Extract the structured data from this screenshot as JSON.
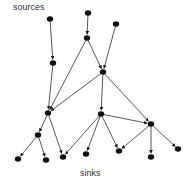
{
  "labels": {
    "top": "sources",
    "bottom": "sinks"
  },
  "colors": {
    "node": "#111111",
    "edge": "#444444",
    "text": "#333333",
    "background": "#ffffff"
  },
  "graph": {
    "type": "directed-acyclic-graph",
    "nodes": [
      {
        "id": "s1",
        "x": 50,
        "y": 19,
        "role": "source"
      },
      {
        "id": "s2",
        "x": 88,
        "y": 13,
        "role": "source"
      },
      {
        "id": "s3",
        "x": 116,
        "y": 24,
        "role": "source"
      },
      {
        "id": "a",
        "x": 87,
        "y": 38,
        "role": "internal"
      },
      {
        "id": "b",
        "x": 53,
        "y": 63,
        "role": "internal"
      },
      {
        "id": "c",
        "x": 103,
        "y": 72,
        "role": "internal"
      },
      {
        "id": "d",
        "x": 48,
        "y": 113,
        "role": "internal"
      },
      {
        "id": "e",
        "x": 101,
        "y": 114,
        "role": "internal"
      },
      {
        "id": "f",
        "x": 151,
        "y": 124,
        "role": "internal"
      },
      {
        "id": "g",
        "x": 38,
        "y": 135,
        "role": "internal"
      },
      {
        "id": "t1",
        "x": 18,
        "y": 159,
        "role": "sink"
      },
      {
        "id": "t2",
        "x": 46,
        "y": 160,
        "role": "sink"
      },
      {
        "id": "t3",
        "x": 63,
        "y": 157,
        "role": "sink"
      },
      {
        "id": "t4",
        "x": 86,
        "y": 154,
        "role": "sink"
      },
      {
        "id": "t5",
        "x": 119,
        "y": 151,
        "role": "sink"
      },
      {
        "id": "t6",
        "x": 151,
        "y": 157,
        "role": "sink"
      },
      {
        "id": "t7",
        "x": 178,
        "y": 149,
        "role": "sink"
      }
    ],
    "edges": [
      [
        "s1",
        "b"
      ],
      [
        "s2",
        "a"
      ],
      [
        "s3",
        "c"
      ],
      [
        "b",
        "d"
      ],
      [
        "a",
        "d"
      ],
      [
        "a",
        "c"
      ],
      [
        "c",
        "d"
      ],
      [
        "c",
        "e"
      ],
      [
        "c",
        "f"
      ],
      [
        "e",
        "f"
      ],
      [
        "e",
        "t3"
      ],
      [
        "e",
        "t4"
      ],
      [
        "e",
        "t5"
      ],
      [
        "f",
        "t5"
      ],
      [
        "f",
        "t6"
      ],
      [
        "f",
        "t7"
      ],
      [
        "d",
        "g"
      ],
      [
        "d",
        "t3"
      ],
      [
        "g",
        "t1"
      ],
      [
        "g",
        "t2"
      ]
    ]
  }
}
